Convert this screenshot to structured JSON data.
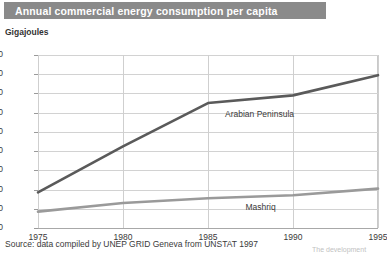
{
  "title": "Annual commercial energy consumption per capita",
  "unit_label": "Gigajoules",
  "source": "Source: data compiled by UNEP GRID Geneva from UNSTAT 1997",
  "corner_note": "The development",
  "colors": {
    "title_bar": "#8a8a8a",
    "title_text": "#ffffff",
    "arabian_line": "#5a5a5a",
    "mashriq_line": "#9a9a9a",
    "grid": "#d2d2d2",
    "axis": "#a8a8a8",
    "text": "#3a3a3a"
  },
  "chart_data": {
    "type": "line",
    "title": "Annual commercial energy consumption per capita",
    "xlabel": "",
    "ylabel": "Gigajoules",
    "ylim": [
      0,
      180
    ],
    "xlim": [
      1975,
      1995
    ],
    "grid": true,
    "legend": "inline-labels",
    "yticks": [
      0,
      20,
      40,
      60,
      80,
      100,
      120,
      140,
      160,
      180
    ],
    "xticks": [
      1975,
      1980,
      1985,
      1990,
      1995
    ],
    "x": [
      1975,
      1980,
      1985,
      1990,
      1995
    ],
    "series": [
      {
        "name": "Arabian Peninsula",
        "color": "#5a5a5a",
        "values": [
          37,
          85,
          130,
          138,
          159
        ],
        "label_x": 1986.0,
        "label_y": 118
      },
      {
        "name": "Mashriq",
        "color": "#9a9a9a",
        "values": [
          17,
          26,
          31,
          34,
          41
        ],
        "label_x": 1987.2,
        "label_y": 21
      }
    ]
  }
}
